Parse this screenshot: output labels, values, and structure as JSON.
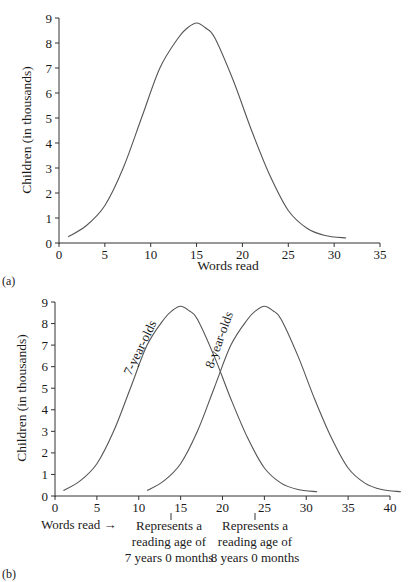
{
  "chart_data": [
    {
      "panel": "(a)",
      "type": "line",
      "title": "",
      "xlabel": "Words read",
      "ylabel": "Children (in thousands)",
      "xlim": [
        0,
        35
      ],
      "ylim": [
        0,
        9
      ],
      "x_ticks": [
        0,
        5,
        10,
        15,
        20,
        25,
        30,
        35
      ],
      "y_ticks": [
        0,
        1,
        2,
        3,
        4,
        5,
        6,
        7,
        8,
        9
      ],
      "grid": false,
      "series": [
        {
          "name": "Children",
          "x": [
            1,
            3,
            5,
            7,
            9,
            11,
            13,
            14,
            15,
            16,
            17,
            19,
            21,
            23,
            25,
            27,
            29,
            31.3
          ],
          "y": [
            0.25,
            0.7,
            1.5,
            3.0,
            5.0,
            7.0,
            8.2,
            8.6,
            8.8,
            8.6,
            8.2,
            6.5,
            4.5,
            2.7,
            1.3,
            0.6,
            0.3,
            0.2
          ]
        }
      ]
    },
    {
      "panel": "(b)",
      "type": "line",
      "title": "",
      "xlabel": "Words read →",
      "ylabel": "Children (in thousands)",
      "xlim": [
        0,
        40
      ],
      "ylim": [
        0,
        9
      ],
      "x_ticks": [
        0,
        5,
        10,
        15,
        20,
        25,
        30,
        35,
        40
      ],
      "y_ticks": [
        0,
        1,
        2,
        3,
        4,
        5,
        6,
        7,
        8,
        9
      ],
      "grid": false,
      "legend": "none (inline curve labels)",
      "series": [
        {
          "name": "7-year-olds",
          "x": [
            1,
            3,
            5,
            7,
            9,
            11,
            13,
            14,
            15,
            16,
            17,
            19,
            21,
            23,
            25,
            27,
            29,
            31.3
          ],
          "y": [
            0.25,
            0.7,
            1.5,
            3.0,
            5.0,
            7.0,
            8.2,
            8.6,
            8.8,
            8.6,
            8.2,
            6.5,
            4.5,
            2.7,
            1.3,
            0.6,
            0.3,
            0.2
          ]
        },
        {
          "name": "8-year-olds",
          "x": [
            11,
            13,
            15,
            17,
            19,
            21,
            23,
            24,
            25,
            26,
            27,
            29,
            31,
            33,
            35,
            37,
            39,
            41.3
          ],
          "y": [
            0.25,
            0.7,
            1.5,
            3.0,
            5.0,
            7.0,
            8.2,
            8.6,
            8.8,
            8.6,
            8.2,
            6.5,
            4.5,
            2.7,
            1.3,
            0.6,
            0.3,
            0.2
          ]
        }
      ],
      "annotations": [
        {
          "x": 15,
          "text": "Represents a reading age of 7 years 0 months"
        },
        {
          "x": 25,
          "text": "Represents a reading age of 8 years 0 months"
        }
      ]
    }
  ],
  "labels": {
    "a": {
      "panel": "(a)",
      "xlabel": "Words read",
      "ylabel": "Children (in thousands)"
    },
    "b": {
      "panel": "(b)",
      "xlabel": "Words read →",
      "ylabel": "Children (in thousands)",
      "series1": "7-year-olds",
      "series2": "8-year-olds",
      "annot1": [
        "Represents a",
        "reading age of",
        "7 years 0 months"
      ],
      "annot2": [
        "Represents a",
        "reading age of",
        "8 years 0 months"
      ]
    }
  }
}
